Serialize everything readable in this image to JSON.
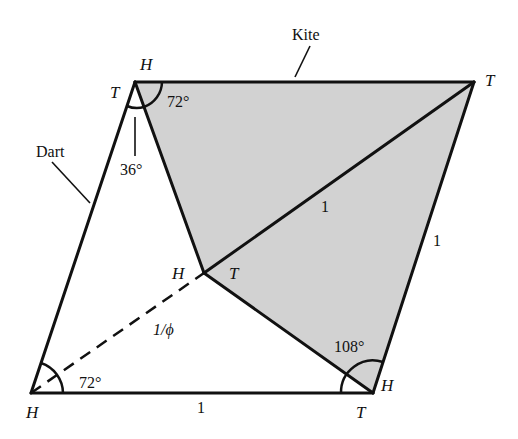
{
  "figure": {
    "shape_labels": {
      "kite": "Kite",
      "dart": "Dart"
    },
    "vertex_labels": {
      "top_left_H": "H",
      "top_left_T": "T",
      "top_right_T": "T",
      "inner_H": "H",
      "inner_T": "T",
      "bottom_left_H": "H",
      "bottom_right_H": "H",
      "bottom_right_T": "T"
    },
    "angle_labels": {
      "top_kite": "72°",
      "top_dart": "36°",
      "bottom_left": "72°",
      "bottom_right": "108°"
    },
    "length_labels": {
      "kite_diagonal": "1",
      "right_side": "1",
      "bottom_side": "1",
      "dashed_segment": "1/ϕ"
    },
    "colors": {
      "kite_fill": "#d2d2d2",
      "stroke": "#111111",
      "background": "#ffffff"
    }
  }
}
